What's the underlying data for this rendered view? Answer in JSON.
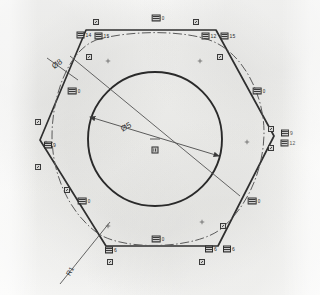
{
  "drawing": {
    "title": "Hexagonal profile CAD drawing scan",
    "background_color": "#fbfbfa",
    "line_color": "#2b2b2b",
    "dimensions": [
      {
        "id": "dia8",
        "text": "Ø8",
        "x": 57,
        "y": 64,
        "rotate": -36
      },
      {
        "id": "dia5",
        "text": "Ø5",
        "x": 126,
        "y": 127,
        "rotate": -28
      },
      {
        "id": "r1",
        "text": "R1",
        "x": 70,
        "y": 271,
        "rotate": -62
      }
    ],
    "center_label": {
      "x": 155,
      "y": 150
    },
    "edge_labels": [
      {
        "id": "l-top-left-a",
        "value": "14",
        "x": 84,
        "y": 35
      },
      {
        "id": "l-top-left-b",
        "value": "15",
        "x": 102,
        "y": 36
      },
      {
        "id": "l-top-right-a",
        "value": "12",
        "x": 209,
        "y": 36
      },
      {
        "id": "l-top-right-b",
        "value": "15",
        "x": 228,
        "y": 36
      },
      {
        "id": "l-right-a",
        "value": "9",
        "x": 287,
        "y": 133
      },
      {
        "id": "l-right-b",
        "value": "12",
        "x": 288,
        "y": 143
      },
      {
        "id": "l-left-a",
        "value": "9",
        "x": 50,
        "y": 145
      },
      {
        "id": "l-bot-left-a",
        "value": "6",
        "x": 111,
        "y": 250
      },
      {
        "id": "l-bot-right-a",
        "value": "6",
        "x": 211,
        "y": 249
      },
      {
        "id": "l-bot-right-b",
        "value": "6",
        "x": 229,
        "y": 249
      },
      {
        "id": "l-edge-topmid",
        "value": "0",
        "x": 158,
        "y": 18
      },
      {
        "id": "l-edge-upleft",
        "value": "0",
        "x": 74,
        "y": 91
      },
      {
        "id": "l-edge-upright",
        "value": "0",
        "x": 259,
        "y": 91
      },
      {
        "id": "l-edge-lowleft",
        "value": "0",
        "x": 84,
        "y": 201
      },
      {
        "id": "l-edge-lowright",
        "value": "0",
        "x": 254,
        "y": 201
      },
      {
        "id": "l-edge-botmid",
        "value": "0",
        "x": 158,
        "y": 239
      }
    ],
    "node_markers": [
      {
        "id": "n1",
        "x": 96,
        "y": 22
      },
      {
        "id": "n2",
        "x": 196,
        "y": 22
      },
      {
        "id": "n3",
        "x": 89,
        "y": 57
      },
      {
        "id": "n4",
        "x": 220,
        "y": 57
      },
      {
        "id": "n5",
        "x": 38,
        "y": 122
      },
      {
        "id": "n6",
        "x": 38,
        "y": 167
      },
      {
        "id": "n7",
        "x": 271,
        "y": 129
      },
      {
        "id": "n8",
        "x": 271,
        "y": 148
      },
      {
        "id": "n9",
        "x": 67,
        "y": 190
      },
      {
        "id": "n10",
        "x": 223,
        "y": 226
      },
      {
        "id": "n11",
        "x": 110,
        "y": 262
      },
      {
        "id": "n12",
        "x": 202,
        "y": 262
      }
    ],
    "cross_markers": [
      {
        "id": "c1",
        "x": 108,
        "y": 61
      },
      {
        "id": "c2",
        "x": 200,
        "y": 61
      },
      {
        "id": "c3",
        "x": 46,
        "y": 143
      },
      {
        "id": "c4",
        "x": 247,
        "y": 142
      },
      {
        "id": "c5",
        "x": 202,
        "y": 222
      },
      {
        "id": "c6",
        "x": 108,
        "y": 226
      }
    ],
    "geometry": {
      "hexagon_points": "86,30 216,30 274,136 218,246 106,246 40,140",
      "circle": {
        "cx": 155,
        "cy": 139,
        "r": 67
      },
      "scallop_path": "M 96,40 C 130,30 185,30 212,41 C 244,54 264,96 264,132 C 264,166 250,204 222,228 C 198,249 122,252 96,232 C 66,209 52,170 52,136 C 52,100 66,52 96,40 Z"
    }
  }
}
